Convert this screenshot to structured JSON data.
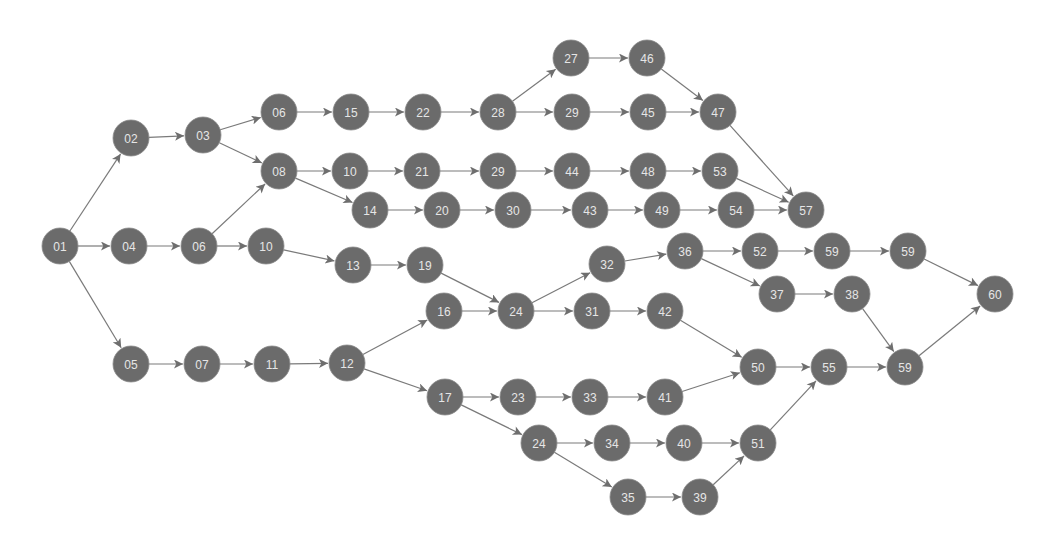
{
  "diagram": {
    "type": "directed-network",
    "node_radius": 18,
    "colors": {
      "node_fill": "#6b6b6b",
      "node_label": "#e6e6e6",
      "edge": "#7a7a7a",
      "background": "#ffffff"
    },
    "nodes": [
      {
        "id": "n01",
        "label": "01",
        "x": 60,
        "y": 246
      },
      {
        "id": "n02",
        "label": "02",
        "x": 131,
        "y": 138
      },
      {
        "id": "n03",
        "label": "03",
        "x": 203,
        "y": 135
      },
      {
        "id": "n04",
        "label": "04",
        "x": 129,
        "y": 246
      },
      {
        "id": "n06b",
        "label": "06",
        "x": 199,
        "y": 246
      },
      {
        "id": "n05",
        "label": "05",
        "x": 131,
        "y": 364
      },
      {
        "id": "n07",
        "label": "07",
        "x": 202,
        "y": 364
      },
      {
        "id": "n11",
        "label": "11",
        "x": 272,
        "y": 364
      },
      {
        "id": "n12",
        "label": "12",
        "x": 347,
        "y": 363
      },
      {
        "id": "n06a",
        "label": "06",
        "x": 279,
        "y": 112
      },
      {
        "id": "n08",
        "label": "08",
        "x": 279,
        "y": 171
      },
      {
        "id": "n10b",
        "label": "10",
        "x": 266,
        "y": 246
      },
      {
        "id": "n15",
        "label": "15",
        "x": 351,
        "y": 112
      },
      {
        "id": "n22",
        "label": "22",
        "x": 423,
        "y": 112
      },
      {
        "id": "n28",
        "label": "28",
        "x": 498,
        "y": 112
      },
      {
        "id": "n27",
        "label": "27",
        "x": 571,
        "y": 58
      },
      {
        "id": "n46",
        "label": "46",
        "x": 647,
        "y": 58
      },
      {
        "id": "n29a",
        "label": "29",
        "x": 572,
        "y": 112
      },
      {
        "id": "n45",
        "label": "45",
        "x": 648,
        "y": 112
      },
      {
        "id": "n47",
        "label": "47",
        "x": 718,
        "y": 112
      },
      {
        "id": "n10a",
        "label": "10",
        "x": 350,
        "y": 171
      },
      {
        "id": "n21",
        "label": "21",
        "x": 422,
        "y": 171
      },
      {
        "id": "n29b",
        "label": "29",
        "x": 498,
        "y": 171
      },
      {
        "id": "n44",
        "label": "44",
        "x": 572,
        "y": 171
      },
      {
        "id": "n48",
        "label": "48",
        "x": 648,
        "y": 171
      },
      {
        "id": "n53",
        "label": "53",
        "x": 720,
        "y": 171
      },
      {
        "id": "n57",
        "label": "57",
        "x": 806,
        "y": 210
      },
      {
        "id": "n14",
        "label": "14",
        "x": 370,
        "y": 210
      },
      {
        "id": "n20",
        "label": "20",
        "x": 442,
        "y": 210
      },
      {
        "id": "n30",
        "label": "30",
        "x": 513,
        "y": 210
      },
      {
        "id": "n43",
        "label": "43",
        "x": 590,
        "y": 210
      },
      {
        "id": "n49",
        "label": "49",
        "x": 662,
        "y": 210
      },
      {
        "id": "n54",
        "label": "54",
        "x": 736,
        "y": 210
      },
      {
        "id": "n13",
        "label": "13",
        "x": 353,
        "y": 265
      },
      {
        "id": "n19",
        "label": "19",
        "x": 425,
        "y": 265
      },
      {
        "id": "n16",
        "label": "16",
        "x": 444,
        "y": 311
      },
      {
        "id": "n24a",
        "label": "24",
        "x": 516,
        "y": 311
      },
      {
        "id": "n32",
        "label": "32",
        "x": 607,
        "y": 264
      },
      {
        "id": "n31",
        "label": "31",
        "x": 592,
        "y": 311
      },
      {
        "id": "n42",
        "label": "42",
        "x": 665,
        "y": 311
      },
      {
        "id": "n36",
        "label": "36",
        "x": 685,
        "y": 251
      },
      {
        "id": "n52",
        "label": "52",
        "x": 760,
        "y": 251
      },
      {
        "id": "n59a",
        "label": "59",
        "x": 832,
        "y": 251
      },
      {
        "id": "n59b",
        "label": "59",
        "x": 908,
        "y": 251
      },
      {
        "id": "n37",
        "label": "37",
        "x": 777,
        "y": 294
      },
      {
        "id": "n38",
        "label": "38",
        "x": 852,
        "y": 294
      },
      {
        "id": "n60",
        "label": "60",
        "x": 995,
        "y": 294
      },
      {
        "id": "n50",
        "label": "50",
        "x": 758,
        "y": 367
      },
      {
        "id": "n55",
        "label": "55",
        "x": 829,
        "y": 367
      },
      {
        "id": "n59c",
        "label": "59",
        "x": 905,
        "y": 367
      },
      {
        "id": "n17",
        "label": "17",
        "x": 445,
        "y": 397
      },
      {
        "id": "n23",
        "label": "23",
        "x": 518,
        "y": 397
      },
      {
        "id": "n33",
        "label": "33",
        "x": 590,
        "y": 397
      },
      {
        "id": "n41",
        "label": "41",
        "x": 665,
        "y": 397
      },
      {
        "id": "n24b",
        "label": "24",
        "x": 539,
        "y": 443
      },
      {
        "id": "n34",
        "label": "34",
        "x": 612,
        "y": 443
      },
      {
        "id": "n40",
        "label": "40",
        "x": 684,
        "y": 443
      },
      {
        "id": "n51",
        "label": "51",
        "x": 758,
        "y": 443
      },
      {
        "id": "n35",
        "label": "35",
        "x": 628,
        "y": 497
      },
      {
        "id": "n39",
        "label": "39",
        "x": 700,
        "y": 497
      }
    ],
    "edges": [
      [
        "n01",
        "n02"
      ],
      [
        "n01",
        "n04"
      ],
      [
        "n01",
        "n05"
      ],
      [
        "n02",
        "n03"
      ],
      [
        "n03",
        "n06a"
      ],
      [
        "n03",
        "n08"
      ],
      [
        "n04",
        "n06b"
      ],
      [
        "n06b",
        "n08"
      ],
      [
        "n06b",
        "n10b"
      ],
      [
        "n05",
        "n07"
      ],
      [
        "n07",
        "n11"
      ],
      [
        "n11",
        "n12"
      ],
      [
        "n06a",
        "n15"
      ],
      [
        "n15",
        "n22"
      ],
      [
        "n22",
        "n28"
      ],
      [
        "n28",
        "n27"
      ],
      [
        "n28",
        "n29a"
      ],
      [
        "n27",
        "n46"
      ],
      [
        "n29a",
        "n45"
      ],
      [
        "n46",
        "n47"
      ],
      [
        "n45",
        "n47"
      ],
      [
        "n47",
        "n57"
      ],
      [
        "n08",
        "n10a"
      ],
      [
        "n08",
        "n14"
      ],
      [
        "n10a",
        "n21"
      ],
      [
        "n21",
        "n29b"
      ],
      [
        "n29b",
        "n44"
      ],
      [
        "n44",
        "n48"
      ],
      [
        "n48",
        "n53"
      ],
      [
        "n53",
        "n57"
      ],
      [
        "n14",
        "n20"
      ],
      [
        "n20",
        "n30"
      ],
      [
        "n30",
        "n43"
      ],
      [
        "n43",
        "n49"
      ],
      [
        "n49",
        "n54"
      ],
      [
        "n54",
        "n57"
      ],
      [
        "n10b",
        "n13"
      ],
      [
        "n13",
        "n19"
      ],
      [
        "n19",
        "n24a"
      ],
      [
        "n12",
        "n16"
      ],
      [
        "n12",
        "n17"
      ],
      [
        "n16",
        "n24a"
      ],
      [
        "n24a",
        "n32"
      ],
      [
        "n24a",
        "n31"
      ],
      [
        "n32",
        "n36"
      ],
      [
        "n36",
        "n52"
      ],
      [
        "n36",
        "n37"
      ],
      [
        "n52",
        "n59a"
      ],
      [
        "n59a",
        "n59b"
      ],
      [
        "n59b",
        "n60"
      ],
      [
        "n37",
        "n38"
      ],
      [
        "n38",
        "n59c"
      ],
      [
        "n31",
        "n42"
      ],
      [
        "n42",
        "n50"
      ],
      [
        "n17",
        "n23"
      ],
      [
        "n17",
        "n24b"
      ],
      [
        "n23",
        "n33"
      ],
      [
        "n33",
        "n41"
      ],
      [
        "n41",
        "n50"
      ],
      [
        "n50",
        "n55"
      ],
      [
        "n55",
        "n59c"
      ],
      [
        "n59c",
        "n60"
      ],
      [
        "n24b",
        "n34"
      ],
      [
        "n24b",
        "n35"
      ],
      [
        "n34",
        "n40"
      ],
      [
        "n40",
        "n51"
      ],
      [
        "n35",
        "n39"
      ],
      [
        "n39",
        "n51"
      ],
      [
        "n51",
        "n55"
      ]
    ]
  }
}
